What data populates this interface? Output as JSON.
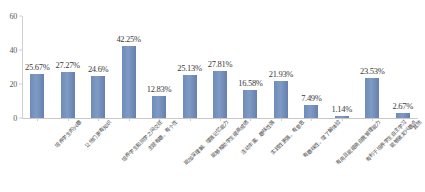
{
  "chart_data": {
    "type": "bar",
    "title": "",
    "subtitle": "",
    "xlabel": "",
    "ylabel": "",
    "ylim": [
      0,
      60
    ],
    "yticks": [
      0,
      20,
      40,
      60
    ],
    "grid": false,
    "legend": false,
    "series_color": "#6b8ab8",
    "categories": [
      "培养学生的兴趣",
      "让他们更有知识",
      "培养学生和同学之间交往",
      "主题有趣、有个性",
      "能加深理解、增强记忆能力",
      "能够帮助学生提高成绩",
      "活动丰富、趣味性强",
      "实践性更强、有意思",
      "有趣味性、增了解体验",
      "有用且能提高自我管理能力",
      "有利于培养学生自主学习",
      "能够激发兴趣点",
      "其他"
    ],
    "values": [
      25.67,
      27.27,
      24.6,
      42.25,
      12.83,
      25.13,
      27.81,
      16.58,
      21.93,
      7.49,
      1.14,
      23.53,
      2.67
    ],
    "value_labels": [
      "25.67%",
      "27.27%",
      "24.6%",
      "42.25%",
      "12.83%",
      "25.13%",
      "27.81%",
      "16.58%",
      "21.93%",
      "7.49%",
      "1.14%",
      "23.53%",
      "2.67%"
    ]
  }
}
